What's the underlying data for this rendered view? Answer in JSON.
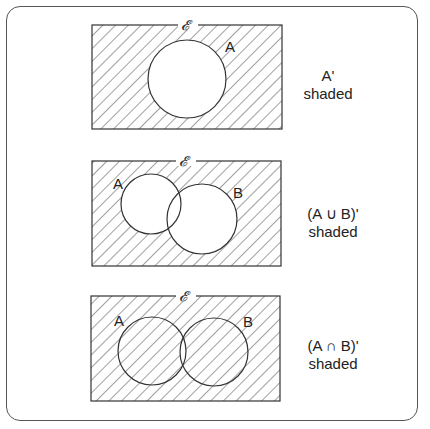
{
  "universal_symbol": "𝓔",
  "diagrams": [
    {
      "id": "complement-a",
      "sets": [
        "A"
      ],
      "caption_line1": "A'",
      "caption_line2": "shaded",
      "shaded_region": "outside A"
    },
    {
      "id": "complement-union",
      "sets": [
        "A",
        "B"
      ],
      "caption_line1": "(A ∪ B)'",
      "caption_line2": "shaded",
      "shaded_region": "outside A and B"
    },
    {
      "id": "complement-intersection",
      "sets": [
        "A",
        "B"
      ],
      "caption_line1": "(A ∩ B)'",
      "caption_line2": "shaded",
      "shaded_region": "everything except A∩B"
    }
  ],
  "colors": {
    "line": "#333333",
    "hatch": "#444444",
    "background": "#ffffff"
  }
}
